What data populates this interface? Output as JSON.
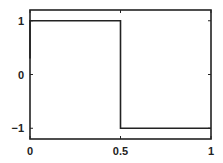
{
  "chart_data": {
    "type": "line",
    "title": "",
    "xlabel": "",
    "ylabel": "",
    "xlim": [
      0,
      1
    ],
    "ylim": [
      -1.2,
      1.2
    ],
    "grid": false,
    "legend": null,
    "x_ticks": [
      {
        "value": 0,
        "label": "0"
      },
      {
        "value": 0.5,
        "label": "0.5"
      },
      {
        "value": 1,
        "label": "1"
      }
    ],
    "y_ticks": [
      {
        "value": 1,
        "label": "1"
      },
      {
        "value": 0,
        "label": "0"
      },
      {
        "value": -1,
        "label": "−1"
      }
    ],
    "series": [
      {
        "name": "square wave",
        "color": "#222222",
        "x": [
          0,
          0,
          0.5,
          0.5,
          1
        ],
        "y": [
          0.3,
          1,
          1,
          -1,
          -1
        ]
      }
    ]
  },
  "colors": {
    "axis": "#222222",
    "line": "#222222",
    "background": "#ffffff"
  }
}
